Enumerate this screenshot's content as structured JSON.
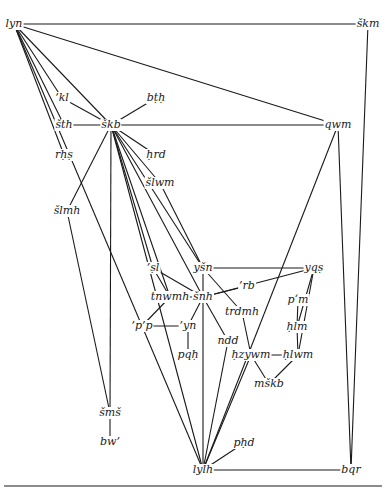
{
  "diagram": {
    "type": "word-network",
    "nodes": [
      {
        "id": "lyn",
        "label": "lyn",
        "x": 14,
        "y": 24
      },
      {
        "id": "skm",
        "label": "škm",
        "x": 368,
        "y": 24
      },
      {
        "id": "kl",
        "label": "’kl",
        "x": 62,
        "y": 98
      },
      {
        "id": "bth",
        "label": "bṭḥ",
        "x": 156,
        "y": 98
      },
      {
        "id": "sth",
        "label": "šth",
        "x": 64,
        "y": 125
      },
      {
        "id": "skb",
        "label": "škb",
        "x": 111,
        "y": 125
      },
      {
        "id": "qwm",
        "label": "qwm",
        "x": 338,
        "y": 125
      },
      {
        "id": "rhs",
        "label": "rḥṣ",
        "x": 64,
        "y": 155
      },
      {
        "id": "hrd",
        "label": "ḥrd",
        "x": 156,
        "y": 155
      },
      {
        "id": "slwm",
        "label": "šlwm",
        "x": 160,
        "y": 183
      },
      {
        "id": "slmh",
        "label": "šlmh",
        "x": 67,
        "y": 211
      },
      {
        "id": "sl",
        "label": "’ṣl",
        "x": 153,
        "y": 268
      },
      {
        "id": "ysn",
        "label": "yšn",
        "x": 203,
        "y": 268
      },
      {
        "id": "yqs",
        "label": "yqṣ",
        "x": 314,
        "y": 268
      },
      {
        "id": "rb",
        "label": "’rb",
        "x": 247,
        "y": 286
      },
      {
        "id": "tnwmh",
        "label": "tnwmh",
        "x": 170,
        "y": 297
      },
      {
        "id": "snh",
        "label": "šnh",
        "x": 203,
        "y": 297
      },
      {
        "id": "pm",
        "label": "p‘m",
        "x": 298,
        "y": 300
      },
      {
        "id": "trdmh",
        "label": "trdmh",
        "x": 242,
        "y": 312
      },
      {
        "id": "pp",
        "label": "’p’p",
        "x": 142,
        "y": 326
      },
      {
        "id": "yn",
        "label": "’yn",
        "x": 188,
        "y": 326
      },
      {
        "id": "hlm",
        "label": "ḥlm",
        "x": 297,
        "y": 327
      },
      {
        "id": "ndd",
        "label": "ndd",
        "x": 228,
        "y": 341
      },
      {
        "id": "pqh",
        "label": "pqḥ",
        "x": 188,
        "y": 355
      },
      {
        "id": "hzywm",
        "label": "ḥzywm",
        "x": 251,
        "y": 355
      },
      {
        "id": "hlwm",
        "label": "ḥlwm",
        "x": 298,
        "y": 355
      },
      {
        "id": "mskb",
        "label": "mškb",
        "x": 269,
        "y": 384
      },
      {
        "id": "sms",
        "label": "šmš",
        "x": 110,
        "y": 413
      },
      {
        "id": "bw",
        "label": "bw’",
        "x": 110,
        "y": 442
      },
      {
        "id": "phd",
        "label": "pḥd",
        "x": 244,
        "y": 443
      },
      {
        "id": "lylh",
        "label": "lylh",
        "x": 203,
        "y": 470
      },
      {
        "id": "bqr",
        "label": "bqr",
        "x": 351,
        "y": 470
      }
    ],
    "edges": [
      [
        "lyn",
        "skm"
      ],
      [
        "lyn",
        "kl"
      ],
      [
        "lyn",
        "sth"
      ],
      [
        "lyn",
        "rhs"
      ],
      [
        "lyn",
        "skb"
      ],
      [
        "lyn",
        "qwm"
      ],
      [
        "lyn",
        "lylh"
      ],
      [
        "kl",
        "skb"
      ],
      [
        "bth",
        "skb"
      ],
      [
        "sth",
        "skb"
      ],
      [
        "skb",
        "qwm"
      ],
      [
        "skb",
        "hrd"
      ],
      [
        "skb",
        "slwm"
      ],
      [
        "skb",
        "slmh"
      ],
      [
        "skb",
        "sl"
      ],
      [
        "skb",
        "tnwmh"
      ],
      [
        "skb",
        "snh"
      ],
      [
        "skb",
        "ysn"
      ],
      [
        "skb",
        "lylh"
      ],
      [
        "skb",
        "sms"
      ],
      [
        "slwm",
        "ysn"
      ],
      [
        "slmh",
        "sms"
      ],
      [
        "sms",
        "bw"
      ],
      [
        "sl",
        "tnwmh"
      ],
      [
        "sl",
        "snh"
      ],
      [
        "ysn",
        "snh"
      ],
      [
        "ysn",
        "yqs"
      ],
      [
        "ysn",
        "trdmh"
      ],
      [
        "tnwmh",
        "snh"
      ],
      [
        "tnwmh",
        "pp"
      ],
      [
        "snh",
        "rb"
      ],
      [
        "snh",
        "yqs"
      ],
      [
        "snh",
        "yn"
      ],
      [
        "snh",
        "ndd"
      ],
      [
        "snh",
        "lylh"
      ],
      [
        "pp",
        "yn"
      ],
      [
        "yn",
        "pqh"
      ],
      [
        "trdmh",
        "hzywm"
      ],
      [
        "hzywm",
        "hlwm"
      ],
      [
        "hzywm",
        "mskb"
      ],
      [
        "hlwm",
        "mskb"
      ],
      [
        "hzywm",
        "lylh"
      ],
      [
        "ndd",
        "lylh"
      ],
      [
        "yqs",
        "hlm"
      ],
      [
        "yqs",
        "hlwm"
      ],
      [
        "pm",
        "hlm"
      ],
      [
        "hlm",
        "hlwm"
      ],
      [
        "phd",
        "lylh"
      ],
      [
        "lylh",
        "bqr"
      ],
      [
        "lylh",
        "qwm"
      ],
      [
        "qwm",
        "bqr"
      ],
      [
        "skm",
        "bqr"
      ]
    ]
  }
}
